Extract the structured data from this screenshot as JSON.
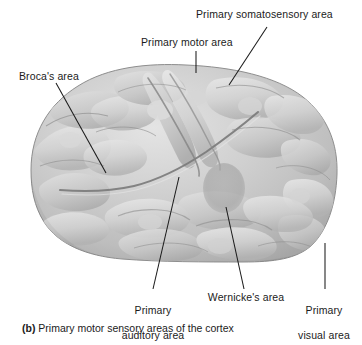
{
  "figure": {
    "caption_tag": "(b)",
    "caption_text": "Primary motor sensory areas of the cortex",
    "colors": {
      "background": "#ffffff",
      "cortex_light": "#dcdcdc",
      "cortex_mid": "#c0c0c0",
      "cortex_dark": "#9a9a9a",
      "sulcus_line": "#6e6e6e",
      "highlight_region": "#a8a8a8",
      "leader_line": "#1b1b1b",
      "label_text": "#1b1b1b"
    }
  },
  "labels": [
    {
      "id": "primary-somatosensory-area",
      "text": "Primary somatosensory area",
      "lines": [
        "Primary somatosensory area"
      ],
      "align": "left",
      "x": 196,
      "y": 8,
      "leader": {
        "x1": 267,
        "y1": 27,
        "x2": 229,
        "y2": 85
      }
    },
    {
      "id": "primary-motor-area",
      "text": "Primary motor area",
      "lines": [
        "Primary motor area"
      ],
      "align": "left",
      "x": 141,
      "y": 36,
      "leader": {
        "x1": 196,
        "y1": 51,
        "x2": 196,
        "y2": 73
      }
    },
    {
      "id": "brocas-area",
      "text": "Broca's area",
      "lines": [
        "Broca's area"
      ],
      "align": "left",
      "x": 19,
      "y": 70,
      "leader": {
        "x1": 56,
        "y1": 83,
        "x2": 106,
        "y2": 173
      }
    },
    {
      "id": "primary-auditory-area",
      "text": "Primary auditory area",
      "lines": [
        "Primary",
        "auditory area"
      ],
      "align": "center",
      "x": 114,
      "y": 291,
      "leader": {
        "x1": 179,
        "y1": 177,
        "x2": 153,
        "y2": 289
      }
    },
    {
      "id": "wernickes-area",
      "text": "Wernicke's area",
      "lines": [
        "Wernicke's area"
      ],
      "align": "center",
      "x": 205,
      "y": 291,
      "leader": {
        "x1": 226,
        "y1": 207,
        "x2": 244,
        "y2": 289
      }
    },
    {
      "id": "primary-visual-area",
      "text": "Primary visual area",
      "lines": [
        "Primary",
        "visual area"
      ],
      "align": "center",
      "x": 292,
      "y": 291,
      "leader": {
        "x1": 325,
        "y1": 243,
        "x2": 325,
        "y2": 289
      }
    }
  ]
}
